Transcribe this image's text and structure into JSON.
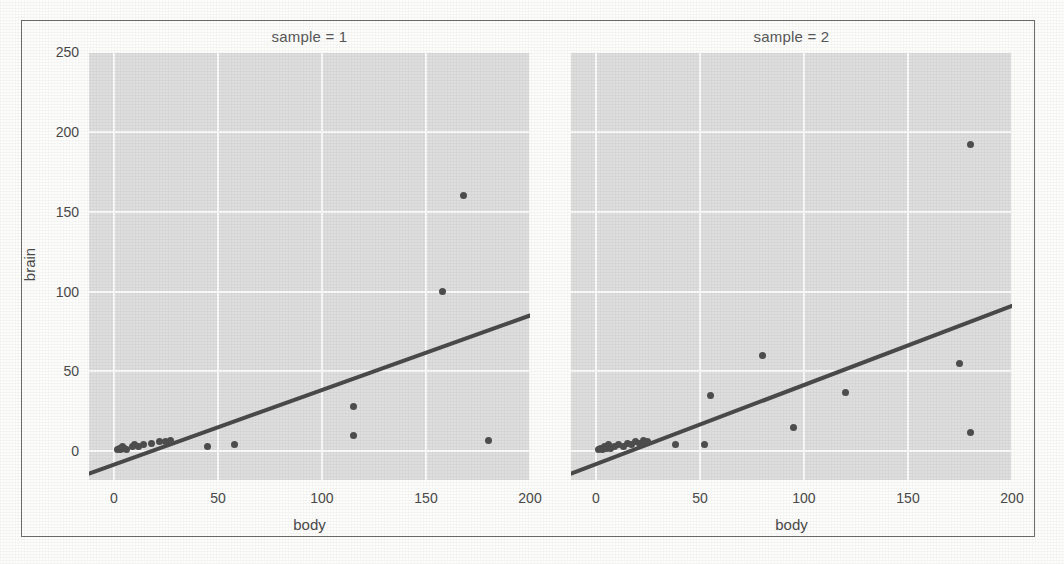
{
  "figure": {
    "kind": "faceted-scatter-with-regression",
    "background_color": "#dedede",
    "grid_color": "#fafafa",
    "point_color": "#4e4e4e",
    "line_color": "#4a4a4a",
    "border_color": "#6d6d6d"
  },
  "chart_data": {
    "type": "scatter",
    "title": "",
    "xlabel": "body",
    "ylabel": "brain",
    "xlim": [
      -12,
      200
    ],
    "ylim": [
      -18,
      250
    ],
    "xticks": [
      0,
      50,
      100,
      150,
      200
    ],
    "yticks": [
      0,
      50,
      100,
      150,
      200,
      250
    ],
    "grid": true,
    "legend": "none",
    "facet_variable": "sample",
    "panels": [
      {
        "label": "sample = 1",
        "facet_value": "1",
        "points": [
          {
            "x": 1.5,
            "y": 1
          },
          {
            "x": 2.5,
            "y": 2
          },
          {
            "x": 3,
            "y": 1
          },
          {
            "x": 4,
            "y": 3
          },
          {
            "x": 5,
            "y": 2
          },
          {
            "x": 6,
            "y": 1
          },
          {
            "x": 9,
            "y": 3
          },
          {
            "x": 10,
            "y": 4
          },
          {
            "x": 12,
            "y": 3
          },
          {
            "x": 14,
            "y": 4
          },
          {
            "x": 18,
            "y": 5
          },
          {
            "x": 22,
            "y": 6
          },
          {
            "x": 25,
            "y": 6
          },
          {
            "x": 27,
            "y": 7
          },
          {
            "x": 45,
            "y": 3
          },
          {
            "x": 58,
            "y": 4
          },
          {
            "x": 115,
            "y": 28
          },
          {
            "x": 115,
            "y": 10
          },
          {
            "x": 158,
            "y": 100
          },
          {
            "x": 168,
            "y": 160
          },
          {
            "x": 180,
            "y": 7
          }
        ],
        "regression": {
          "x0": -12,
          "y0": -14,
          "x1": 200,
          "y1": 85
        }
      },
      {
        "label": "sample = 2",
        "facet_value": "2",
        "points": [
          {
            "x": 1,
            "y": 1
          },
          {
            "x": 2,
            "y": 2
          },
          {
            "x": 3,
            "y": 1
          },
          {
            "x": 4,
            "y": 3
          },
          {
            "x": 5,
            "y": 2
          },
          {
            "x": 6,
            "y": 4
          },
          {
            "x": 7,
            "y": 2
          },
          {
            "x": 9,
            "y": 3
          },
          {
            "x": 11,
            "y": 4
          },
          {
            "x": 13,
            "y": 3
          },
          {
            "x": 15,
            "y": 5
          },
          {
            "x": 17,
            "y": 4
          },
          {
            "x": 19,
            "y": 6
          },
          {
            "x": 21,
            "y": 5
          },
          {
            "x": 23,
            "y": 7
          },
          {
            "x": 25,
            "y": 6
          },
          {
            "x": 38,
            "y": 4
          },
          {
            "x": 52,
            "y": 4
          },
          {
            "x": 55,
            "y": 35
          },
          {
            "x": 80,
            "y": 60
          },
          {
            "x": 95,
            "y": 15
          },
          {
            "x": 120,
            "y": 37
          },
          {
            "x": 175,
            "y": 55
          },
          {
            "x": 180,
            "y": 192
          },
          {
            "x": 180,
            "y": 12
          }
        ],
        "regression": {
          "x0": -12,
          "y0": -14,
          "x1": 200,
          "y1": 91
        }
      }
    ]
  }
}
